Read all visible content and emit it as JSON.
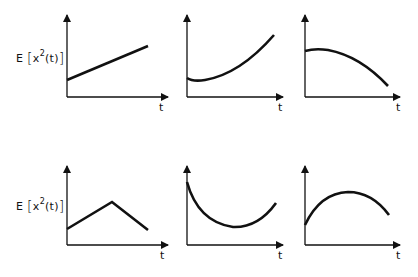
{
  "figure": {
    "rows": [
      {
        "ylabel": {
          "prefix": "E",
          "open": "[",
          "var": "x",
          "exp": "2",
          "arg": "(t)",
          "close": "]"
        },
        "panels": [
          {
            "id": "linear-increase",
            "xlabel": "t",
            "shape": "linear increasing"
          },
          {
            "id": "convex-increase",
            "xlabel": "t",
            "shape": "convex increasing"
          },
          {
            "id": "concave-decrease",
            "xlabel": "t",
            "shape": "concave decreasing"
          }
        ]
      },
      {
        "ylabel": {
          "prefix": "E",
          "open": "[",
          "var": "x",
          "exp": "2",
          "arg": "(t)",
          "close": "]"
        },
        "panels": [
          {
            "id": "triangular",
            "xlabel": "t",
            "shape": "rise then fall (piecewise linear)"
          },
          {
            "id": "u-shaped",
            "xlabel": "t",
            "shape": "decrease then increase"
          },
          {
            "id": "arch",
            "xlabel": "t",
            "shape": "increase then decrease"
          }
        ]
      }
    ],
    "colors": {
      "ink": "#111111",
      "background": "#ffffff"
    }
  }
}
